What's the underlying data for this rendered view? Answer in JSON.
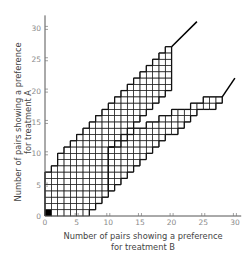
{
  "chart_data": {
    "type": "heatmap",
    "title": "",
    "xlabel": "Number of pairs showing a preference for treatment B",
    "ylabel": "Number of pairs showing a preference for treatment A",
    "xlabel_lines": [
      "Number of pairs showing a preference",
      "for treatment B"
    ],
    "ylabel_lines": [
      "Number of pairs showing a preference",
      "for treatment A"
    ],
    "xlim": [
      0,
      31
    ],
    "ylim": [
      0,
      32
    ],
    "x_ticks": [
      0,
      5,
      10,
      15,
      20,
      25,
      30
    ],
    "y_ticks": [
      0,
      5,
      10,
      15,
      20,
      25,
      30
    ],
    "origin_cell_filled": [
      0,
      0
    ],
    "upper_arm": {
      "columns": [
        {
          "x": 0,
          "y_min": 0,
          "y_max": 7
        },
        {
          "x": 1,
          "y_min": 0,
          "y_max": 8
        },
        {
          "x": 2,
          "y_min": 0,
          "y_max": 10
        },
        {
          "x": 3,
          "y_min": 0,
          "y_max": 11
        },
        {
          "x": 4,
          "y_min": 0,
          "y_max": 12
        },
        {
          "x": 5,
          "y_min": 0,
          "y_max": 13
        },
        {
          "x": 6,
          "y_min": 0,
          "y_max": 14
        },
        {
          "x": 7,
          "y_min": 1,
          "y_max": 15
        },
        {
          "x": 8,
          "y_min": 2,
          "y_max": 16
        },
        {
          "x": 9,
          "y_min": 3,
          "y_max": 17
        },
        {
          "x": 10,
          "y_min": 11,
          "y_max": 18
        },
        {
          "x": 11,
          "y_min": 12,
          "y_max": 19
        },
        {
          "x": 12,
          "y_min": 13,
          "y_max": 20
        },
        {
          "x": 13,
          "y_min": 14,
          "y_max": 21
        },
        {
          "x": 14,
          "y_min": 15,
          "y_max": 22
        },
        {
          "x": 15,
          "y_min": 16,
          "y_max": 23
        },
        {
          "x": 16,
          "y_min": 17,
          "y_max": 24
        },
        {
          "x": 17,
          "y_min": 18,
          "y_max": 25
        },
        {
          "x": 18,
          "y_min": 19,
          "y_max": 26
        },
        {
          "x": 19,
          "y_min": 20,
          "y_max": 27
        }
      ],
      "extension_line": [
        [
          20,
          27
        ],
        [
          24,
          31
        ]
      ]
    },
    "lower_arm": {
      "columns": [
        {
          "x": 10,
          "y_min": 4,
          "y_max": 11
        },
        {
          "x": 11,
          "y_min": 5,
          "y_max": 11
        },
        {
          "x": 12,
          "y_min": 6,
          "y_max": 12
        },
        {
          "x": 13,
          "y_min": 7,
          "y_max": 13
        },
        {
          "x": 14,
          "y_min": 8,
          "y_max": 14
        },
        {
          "x": 15,
          "y_min": 9,
          "y_max": 14
        },
        {
          "x": 16,
          "y_min": 10,
          "y_max": 15
        },
        {
          "x": 17,
          "y_min": 11,
          "y_max": 15
        },
        {
          "x": 18,
          "y_min": 12,
          "y_max": 16
        },
        {
          "x": 19,
          "y_min": 13,
          "y_max": 16
        },
        {
          "x": 20,
          "y_min": 13,
          "y_max": 17
        },
        {
          "x": 21,
          "y_min": 14,
          "y_max": 17
        },
        {
          "x": 22,
          "y_min": 15,
          "y_max": 17
        },
        {
          "x": 23,
          "y_min": 16,
          "y_max": 18
        },
        {
          "x": 24,
          "y_min": 17,
          "y_max": 18
        },
        {
          "x": 25,
          "y_min": 17,
          "y_max": 19
        },
        {
          "x": 26,
          "y_min": 17,
          "y_max": 19
        },
        {
          "x": 27,
          "y_min": 18,
          "y_max": 19
        }
      ],
      "extension_line": [
        [
          28,
          19
        ],
        [
          30,
          22
        ]
      ]
    }
  },
  "colors": {
    "grid": "#222222",
    "axis": "#555555",
    "label": "#8a8a8a",
    "fill_cell": "#000000"
  }
}
